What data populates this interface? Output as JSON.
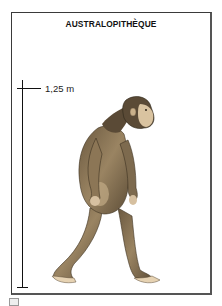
{
  "card": {
    "title": "AUSTRALOPITHÈQUE",
    "scale": {
      "label": "1,25 m"
    },
    "illustration": {
      "subject": "australopithecus-walking-figure",
      "colors": {
        "fur_dark": "#5a4a36",
        "fur_mid": "#8c7656",
        "fur_light": "#c2ab86",
        "skin": "#e6d2b2"
      }
    }
  }
}
